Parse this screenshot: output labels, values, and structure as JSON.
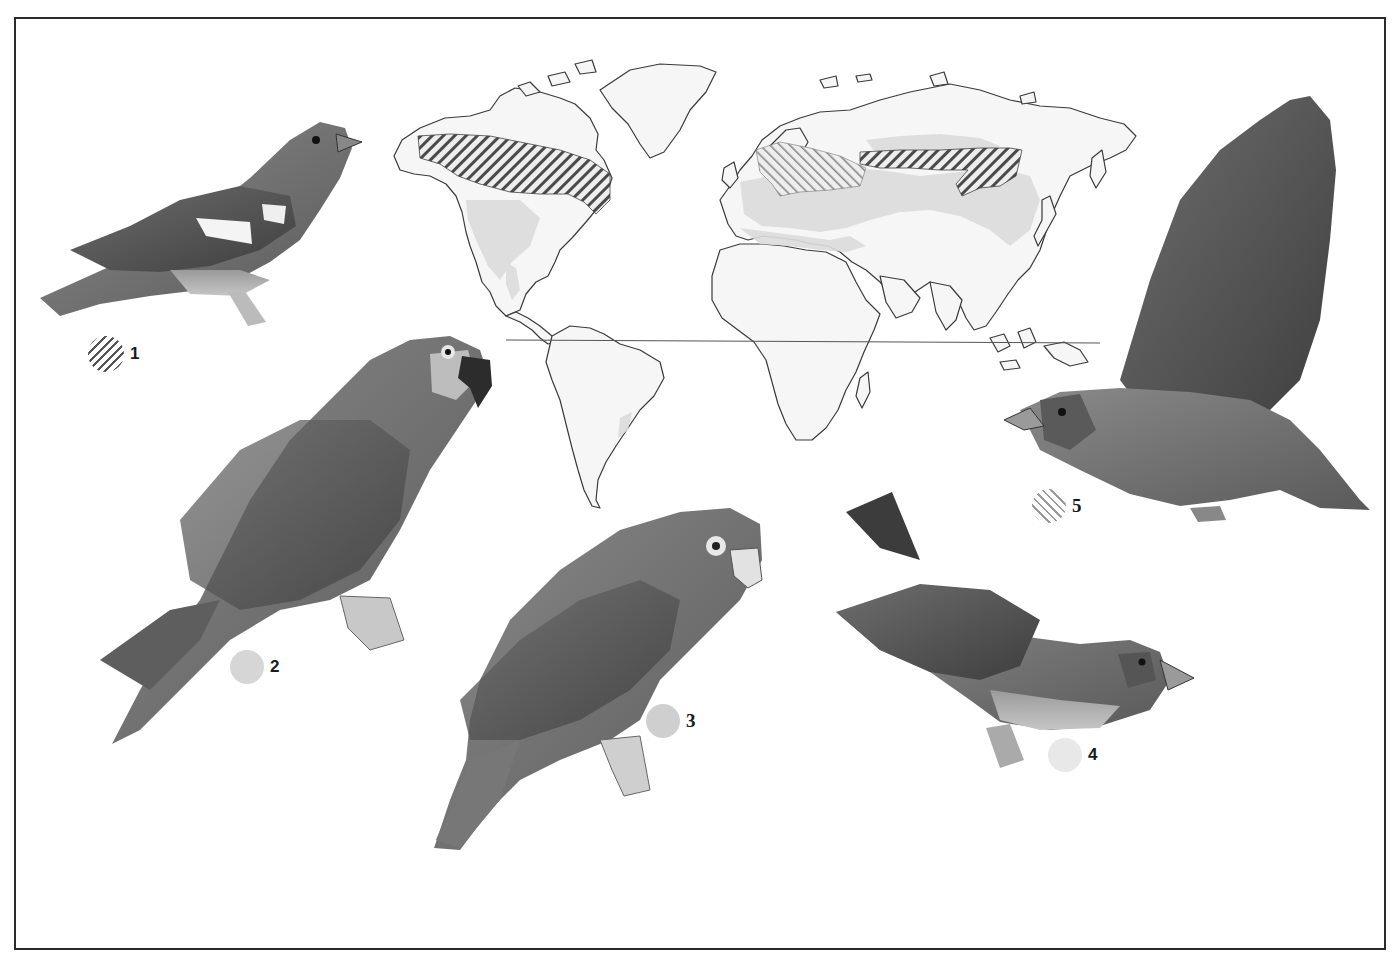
{
  "plate": {
    "frame": {
      "color": "#2a2a2a"
    },
    "map": {
      "land_fill": "#f6f6f6",
      "coast_color": "#3a3a3a",
      "shaded_range_color": "#dedede",
      "equator_color": "#555555",
      "ranges": [
        {
          "key": "1",
          "style": "dark-diagonal-hatch",
          "regions": [
            "Northern North America boreal belt",
            "Central-eastern Siberia belt"
          ]
        },
        {
          "key": "5",
          "style": "light-diagonal-hatch",
          "regions": [
            "Scandinavia / Western Russia"
          ]
        },
        {
          "key": "shaded",
          "style": "light-gray-fill",
          "regions": [
            "Western North America",
            "Central America",
            "Southeast South America",
            "Europe & Mediterranean",
            "Central Asia & China"
          ]
        }
      ]
    },
    "birds": [
      {
        "id": "1",
        "description": "perched finch with white wing bars",
        "icon": "finch-perched"
      },
      {
        "id": "2",
        "description": "perched long-tailed macaw/conure",
        "icon": "parrot-long-tail"
      },
      {
        "id": "3",
        "description": "perched scaly-feathered parrot with pale eye ring",
        "icon": "parrot-scaly"
      },
      {
        "id": "4",
        "description": "perched grosbeak, tail raised",
        "icon": "grosbeak-perched"
      },
      {
        "id": "5",
        "description": "flying grosbeak with wings raised",
        "icon": "grosbeak-flying"
      }
    ],
    "legend": [
      {
        "label": "1",
        "swatch": "hatch-dark"
      },
      {
        "label": "2",
        "swatch": "solid-2"
      },
      {
        "label": "3",
        "swatch": "solid-3"
      },
      {
        "label": "4",
        "swatch": "solid-4"
      },
      {
        "label": "5",
        "swatch": "hatch-light"
      }
    ]
  }
}
